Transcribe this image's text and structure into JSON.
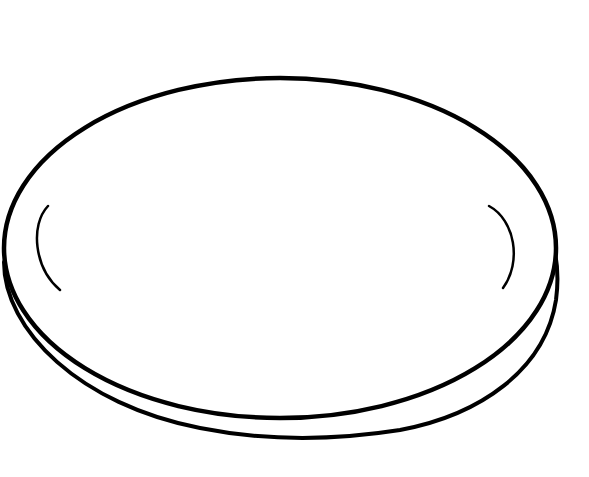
{
  "image": {
    "subject": "plate",
    "style": "black line drawing on white background",
    "colors": {
      "background": "#ffffff",
      "stroke": "#000000"
    }
  },
  "shapes": {
    "rim_top": "outer ellipse rim",
    "rim_bottom": "lower rim edge",
    "highlight_left": "left inner highlight arc",
    "highlight_right": "right inner highlight arc"
  }
}
